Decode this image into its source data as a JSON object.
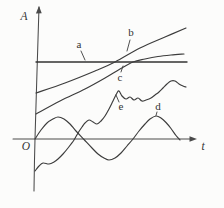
{
  "colors": {
    "background": "#fcfcfb",
    "stroke": "#3c3c3c",
    "stroke_dark": "#333333",
    "stroke_axis": "#4a4a4a"
  },
  "chart_data": {
    "type": "line",
    "title": "",
    "xlabel": "t",
    "ylabel": "A",
    "origin_label": "O",
    "grid": false,
    "legend": "none (curves labeled inline with leader ticks)",
    "axes": {
      "y_axis_px": [
        [
          39,
          7
        ],
        [
          35,
          139
        ],
        [
          34,
          191
        ]
      ],
      "x_axis_px": [
        [
          13,
          139
        ],
        [
          193,
          139
        ]
      ],
      "y_arrow_tip_px": [
        39,
        6
      ],
      "x_arrow_tip_px": [
        197,
        139
      ],
      "origin_px": [
        35,
        139
      ]
    },
    "series": [
      {
        "id": "a",
        "label": "a",
        "shape": "constant horizontal line above t-axis",
        "points_px": [
          [
            36,
            62
          ],
          [
            110,
            62
          ],
          [
            187,
            62
          ]
        ]
      },
      {
        "id": "b",
        "label": "b",
        "shape": "steadily rising nearly straight line, crosses line a",
        "points_px": [
          [
            36,
            93
          ],
          [
            65,
            83
          ],
          [
            95,
            71
          ],
          [
            115,
            62
          ],
          [
            140,
            48
          ],
          [
            165,
            37
          ],
          [
            186,
            28
          ]
        ]
      },
      {
        "id": "c",
        "label": "c",
        "shape": "rising curve that flattens just above line a",
        "points_px": [
          [
            36,
            114
          ],
          [
            60,
            101
          ],
          [
            85,
            89
          ],
          [
            105,
            78
          ],
          [
            120,
            69
          ],
          [
            133,
            62
          ],
          [
            145,
            59
          ],
          [
            158,
            56.5
          ],
          [
            171,
            55
          ],
          [
            184,
            54
          ]
        ]
      },
      {
        "id": "d",
        "label": "d",
        "shape": "sinusoidal oscillation about the t-axis, starts at origin",
        "points_px": [
          [
            35,
            139
          ],
          [
            41,
            130
          ],
          [
            47,
            123
          ],
          [
            53,
            119
          ],
          [
            58,
            117
          ],
          [
            64,
            119
          ],
          [
            70,
            124
          ],
          [
            76,
            131
          ],
          [
            84,
            139.5
          ],
          [
            92,
            148
          ],
          [
            98,
            154
          ],
          [
            104,
            158
          ],
          [
            109,
            160
          ],
          [
            115,
            158
          ],
          [
            121,
            153
          ],
          [
            127,
            146
          ],
          [
            133,
            139
          ],
          [
            139,
            131
          ],
          [
            145,
            124
          ],
          [
            150,
            119
          ],
          [
            156,
            116
          ],
          [
            161,
            118
          ],
          [
            166,
            122.5
          ],
          [
            171,
            128.5
          ],
          [
            176,
            135.5
          ],
          [
            180,
            140
          ]
        ]
      },
      {
        "id": "e",
        "label": "e",
        "shape": "irregular wiggly rising curve, starts below origin",
        "points_px": [
          [
            35,
            171
          ],
          [
            39,
            166
          ],
          [
            43,
            163
          ],
          [
            49,
            164
          ],
          [
            54,
            162
          ],
          [
            58,
            159
          ],
          [
            63,
            154
          ],
          [
            68,
            148
          ],
          [
            74,
            140
          ],
          [
            78,
            133
          ],
          [
            82,
            127
          ],
          [
            85,
            123
          ],
          [
            89,
            120
          ],
          [
            93,
            122
          ],
          [
            97,
            124
          ],
          [
            101,
            121
          ],
          [
            105,
            116
          ],
          [
            109,
            109
          ],
          [
            113,
            101
          ],
          [
            117,
            93
          ],
          [
            119,
            91
          ],
          [
            122,
            96
          ],
          [
            126,
            99
          ],
          [
            130,
            97
          ],
          [
            134,
            100
          ],
          [
            138,
            98
          ],
          [
            142,
            101
          ],
          [
            146,
            100
          ],
          [
            151,
            98
          ],
          [
            155,
            95
          ],
          [
            159,
            92
          ],
          [
            163,
            88
          ],
          [
            167,
            84
          ],
          [
            171,
            81
          ],
          [
            175,
            81
          ],
          [
            179,
            84
          ],
          [
            183,
            86
          ],
          [
            186,
            87
          ]
        ]
      }
    ],
    "curve_labels": [
      {
        "id": "a",
        "text": "a",
        "x": 79,
        "y": 48,
        "leader": [
          81,
          51,
          85,
          60
        ]
      },
      {
        "id": "b",
        "text": "b",
        "x": 131,
        "y": 36,
        "leader": [
          130,
          40,
          127,
          51
        ]
      },
      {
        "id": "c",
        "text": "c",
        "x": 120,
        "y": 81,
        "leader": [
          121,
          72,
          123,
          66
        ]
      },
      {
        "id": "d",
        "text": "d",
        "x": 158,
        "y": 110,
        "leader": [
          157,
          112,
          156,
          115.5
        ]
      },
      {
        "id": "e",
        "text": "e",
        "x": 121,
        "y": 110,
        "leader": [
          119,
          102,
          116,
          95
        ]
      }
    ],
    "axis_labels": [
      {
        "id": "A",
        "text": "A",
        "x": 24,
        "y": 20
      },
      {
        "id": "O",
        "text": "O",
        "x": 26,
        "y": 150
      },
      {
        "id": "t",
        "text": "t",
        "x": 203,
        "y": 150
      }
    ]
  }
}
